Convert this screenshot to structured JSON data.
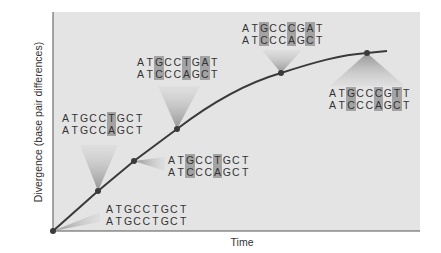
{
  "chart_data": {
    "type": "line",
    "title": "",
    "xlabel": "Time",
    "ylabel": "Divergence (base pair differences)",
    "grid": false,
    "legend": null,
    "points": [
      {
        "x": 0,
        "y": 0,
        "seq1": "ATGCCTGCT",
        "seq2": "ATGCCTGCT",
        "diff_positions": [],
        "differences": 0
      },
      {
        "x": 1,
        "y": 1,
        "seq1": "ATGCCTGCT",
        "seq2": "ATGCCAGCT",
        "diff_positions": [
          5
        ],
        "differences": 1
      },
      {
        "x": 2,
        "y": 2,
        "seq1": "ATGCCTGCT",
        "seq2": "ATCCCAGCT",
        "diff_positions": [
          2,
          5
        ],
        "differences": 2
      },
      {
        "x": 3,
        "y": 3,
        "seq1": "ATGCCTGAT",
        "seq2": "ATCCCAGCT",
        "diff_positions": [
          2,
          5,
          7
        ],
        "differences": 3
      },
      {
        "x": 5.5,
        "y": 4,
        "seq1": "ATGCCCGAT",
        "seq2": "ATCCCAGCT",
        "diff_positions": [
          2,
          5,
          7
        ],
        "differences": 3
      },
      {
        "x": 7.5,
        "y": 4.5,
        "seq1": "ATGCCCGTT",
        "seq2": "ATCCCAGCT",
        "diff_positions": [
          2,
          5,
          7
        ],
        "differences": 3
      }
    ]
  },
  "axes": {
    "x_label": "Time",
    "y_label": "Divergence (base pair differences)"
  },
  "callouts": [
    {
      "id": "c0",
      "seq1": "ATGCCTGCT",
      "seq2": "ATGCCTGCT",
      "diff": []
    },
    {
      "id": "c1",
      "seq1": "ATGCCTGCT",
      "seq2": "ATGCCAGCT",
      "diff": [
        5
      ]
    },
    {
      "id": "c2",
      "seq1": "ATGCCTGCT",
      "seq2": "ATCCCAGCT",
      "diff": [
        2,
        5
      ]
    },
    {
      "id": "c3",
      "seq1": "ATGCCTGAT",
      "seq2": "ATCCCAGCT",
      "diff": [
        2,
        5,
        7
      ]
    },
    {
      "id": "c4",
      "seq1": "ATGCCCGAT",
      "seq2": "ATCCCAGCT",
      "diff": [
        2,
        5,
        7
      ]
    },
    {
      "id": "c5",
      "seq1": "ATGCCCGTT",
      "seq2": "ATCCCAGCT",
      "diff": [
        2,
        5,
        7
      ]
    }
  ],
  "colors": {
    "plot_background": "#e4e4e4",
    "curve": "#3a3a3a",
    "highlight": "#a3a3a3",
    "text": "#333333"
  }
}
